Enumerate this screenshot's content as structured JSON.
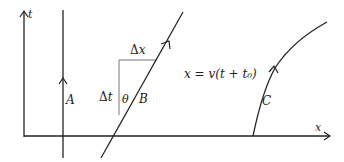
{
  "diagram": {
    "axes": {
      "vertical_label": "t",
      "horizontal_label": "x"
    },
    "worldlines": {
      "A": {
        "label": "A"
      },
      "B": {
        "label": "B",
        "equation": "x = v(t + t₀)"
      },
      "C": {
        "label": "C"
      }
    },
    "triangle": {
      "dx_label": "Δx",
      "dt_label": "Δt",
      "angle_label": "θ"
    },
    "colors": {
      "line": "#222222",
      "aux_line": "#777777"
    }
  }
}
